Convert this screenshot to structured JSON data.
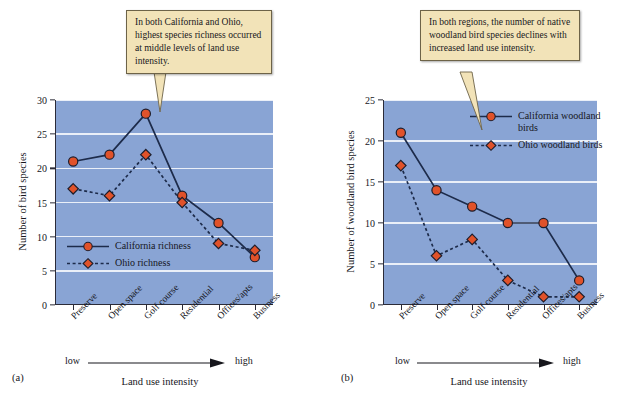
{
  "figure": {
    "panels": [
      {
        "tag": "(a)",
        "callout": "In both California and Ohio, highest species richness occurred at middle levels of land use intensity.",
        "ylabel": "Number of bird species",
        "xlabel": "Land use intensity",
        "low_label": "low",
        "high_label": "high",
        "legend": [
          {
            "label": "California richness",
            "style": "solid-circle",
            "color": "#e0522a"
          },
          {
            "label": "Ohio richness",
            "style": "dashed-diamond",
            "color": "#e0522a"
          }
        ]
      },
      {
        "tag": "(b)",
        "callout": "In both regions, the number of native woodland bird species declines with increased land use intensity.",
        "ylabel": "Number of woodland bird species",
        "xlabel": "Land use intensity",
        "low_label": "low",
        "high_label": "high",
        "legend": [
          {
            "label": "California woodland birds",
            "style": "solid-circle",
            "color": "#e0522a"
          },
          {
            "label": "Ohio woodland birds",
            "style": "dashed-diamond",
            "color": "#e0522a"
          }
        ]
      }
    ],
    "colors": {
      "plot_background": "#89a4d4",
      "gridline": "#f2f5fb",
      "marker_fill": "#e0522a",
      "marker_stroke": "#1d1d2b",
      "line": "#1d2b4a",
      "callout_fill": "#f2e3b8",
      "callout_border": "#6d6348"
    }
  },
  "chart_data": [
    {
      "type": "line",
      "panel": "(a)",
      "title": "",
      "categories": [
        "Preserve",
        "Open space",
        "Golf course",
        "Residential",
        "Offices/apts",
        "Business"
      ],
      "series": [
        {
          "name": "California richness",
          "values": [
            21,
            22,
            28,
            16,
            12,
            7
          ],
          "style": "solid",
          "marker": "circle"
        },
        {
          "name": "Ohio richness",
          "values": [
            17,
            16,
            22,
            15,
            9,
            8
          ],
          "style": "dashed",
          "marker": "diamond"
        }
      ],
      "xlabel": "Land use intensity",
      "ylabel": "Number of bird species",
      "ylim": [
        0,
        30
      ],
      "yticks": [
        0,
        5,
        10,
        15,
        20,
        25,
        30
      ],
      "grid": true,
      "legend_position": "inside-lower-left",
      "annotations": [
        "In both California and Ohio, highest species richness occurred at middle levels of land use intensity."
      ],
      "axis_direction_note": "low → high"
    },
    {
      "type": "line",
      "panel": "(b)",
      "title": "",
      "categories": [
        "Preserve",
        "Open space",
        "Golf course",
        "Residential",
        "Offices/apts",
        "Business"
      ],
      "series": [
        {
          "name": "California woodland birds",
          "values": [
            21,
            14,
            12,
            10,
            10,
            3
          ],
          "style": "solid",
          "marker": "circle"
        },
        {
          "name": "Ohio woodland birds",
          "values": [
            17,
            6,
            8,
            3,
            1,
            1
          ],
          "style": "dashed",
          "marker": "diamond"
        }
      ],
      "xlabel": "Land use intensity",
      "ylabel": "Number of woodland bird species",
      "ylim": [
        0,
        25
      ],
      "yticks": [
        0,
        5,
        10,
        15,
        20,
        25
      ],
      "grid": true,
      "legend_position": "inside-upper-right",
      "annotations": [
        "In both regions, the number of native woodland bird species declines with increased land use intensity."
      ],
      "axis_direction_note": "low → high"
    }
  ]
}
